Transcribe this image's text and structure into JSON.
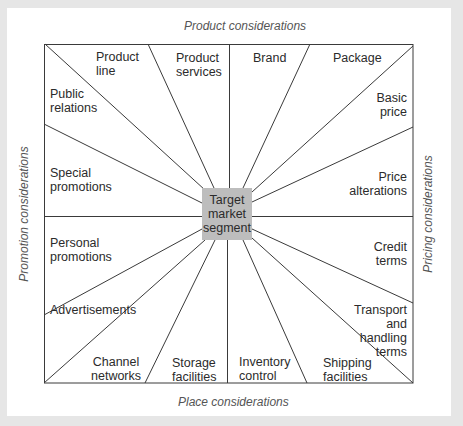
{
  "diagram": {
    "center": {
      "lines": [
        "Target",
        "market",
        "segment"
      ],
      "color": "#bdbdbd"
    },
    "axes": {
      "top": "Product considerations",
      "bottom": "Place considerations",
      "left": "Promotion considerations",
      "right": "Pricing considerations"
    },
    "segments": {
      "product_line": "Product\nline",
      "product_services": "Product\nservices",
      "brand": "Brand",
      "package": "Package",
      "public_relations": "Public\nrelations",
      "basic_price": "Basic\nprice",
      "special_promotions": "Special\npromotions",
      "price_alterations": "Price\nalterations",
      "personal_promotions": "Personal\npromotions",
      "credit_terms": "Credit\nterms",
      "advertisements": "Advertisements",
      "transport_terms": "Transport\nand\nhandling\nterms",
      "channel_networks": "Channel\nnetworks",
      "storage_facilities": "Storage\nfacilities",
      "inventory_control": "Inventory\ncontrol",
      "shipping_facilities": "Shipping\nfacilities"
    },
    "colors": {
      "background": "#e6e6e6",
      "panel": "#ffffff",
      "line": "#3a3a3a"
    }
  }
}
